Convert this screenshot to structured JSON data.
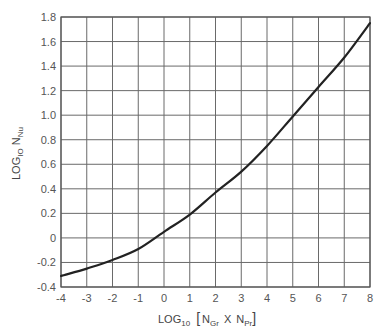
{
  "chart_data": {
    "type": "line",
    "title": "",
    "xlabel": "LOG10 [NGr X NPr]",
    "ylabel": "LOG10 NNu",
    "xlabel_parts": {
      "main": "LOG",
      "sub1": "10",
      "bracket_open": "[",
      "n1": "N",
      "n1_sub": "Gr",
      "times": "X",
      "n2": "N",
      "n2_sub": "Pr",
      "bracket_close": "]"
    },
    "ylabel_parts": {
      "main": "LOG",
      "sub1": "IO",
      "n": "N",
      "n_sub": "Nu"
    },
    "xlim": [
      -4,
      8
    ],
    "ylim": [
      -0.4,
      1.8
    ],
    "grid": true,
    "legend": null,
    "x_ticks": [
      -4,
      -3,
      -2,
      -1,
      0,
      1,
      2,
      3,
      4,
      5,
      6,
      7,
      8
    ],
    "x_tick_labels": [
      "-4",
      "-3",
      "-2",
      "-1",
      "0",
      "1",
      "2",
      "3",
      "4",
      "5",
      "6",
      "7",
      "8"
    ],
    "y_ticks": [
      1.8,
      1.6,
      1.4,
      1.2,
      1.0,
      0.8,
      0.6,
      0.4,
      0.2,
      0,
      -0.2,
      -0.4
    ],
    "y_tick_labels": [
      "1.8",
      "1.6",
      "1.4",
      "1.2",
      "1.0",
      "0.8",
      "0.6",
      "0.4",
      "0.2",
      "0",
      "-0.2",
      "-0.4"
    ],
    "series": [
      {
        "name": "log10 Nu vs log10 (Gr·Pr)",
        "x": [
          -4,
          -3,
          -2,
          -1,
          0,
          1,
          2,
          3,
          4,
          5,
          6,
          7,
          8
        ],
        "y": [
          -0.31,
          -0.25,
          -0.18,
          -0.09,
          0.05,
          0.19,
          0.37,
          0.54,
          0.75,
          0.99,
          1.23,
          1.47,
          1.75
        ]
      }
    ]
  },
  "colors": {
    "curve": "#222222",
    "grid": "#6a6a6a",
    "text": "#555555",
    "background": "#ffffff"
  }
}
